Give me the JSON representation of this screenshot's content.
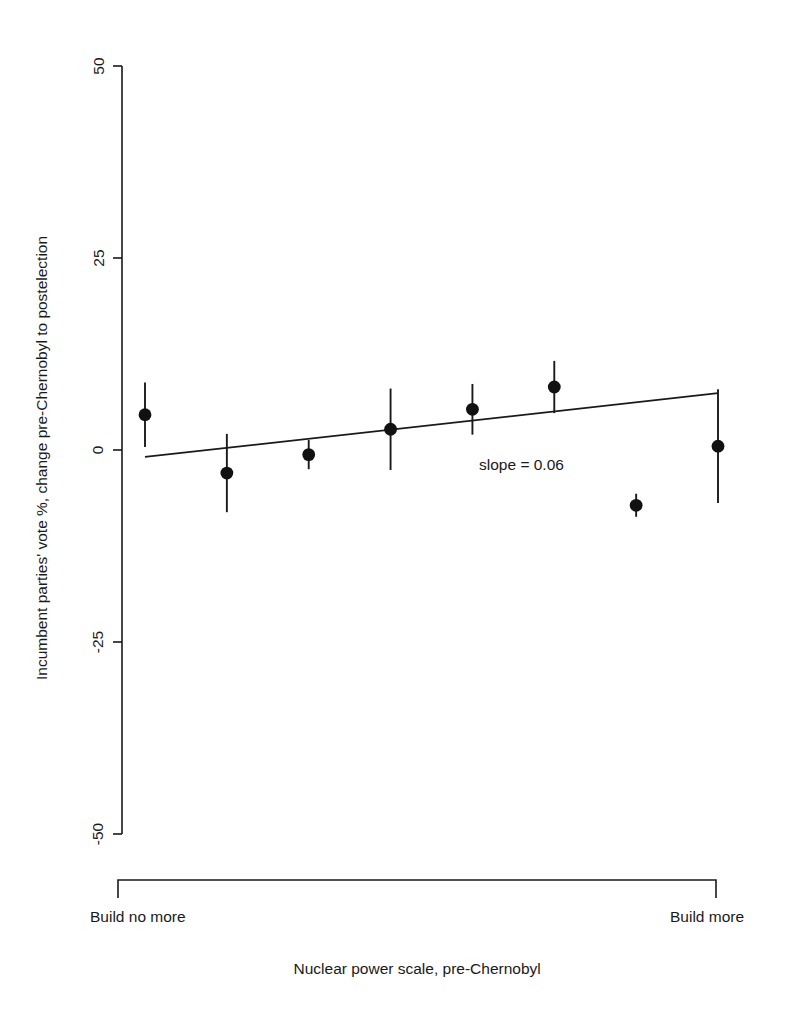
{
  "chart_data": {
    "type": "scatter",
    "title": "",
    "xlabel": "Nuclear power scale, pre-Chernobyl",
    "ylabel": "Incumbent parties' vote %, change pre-Chernobyl to postelection",
    "ylim": [
      -50,
      50
    ],
    "yticks": [
      50,
      25,
      0,
      -25,
      -50
    ],
    "ytick_labels": [
      "50",
      "25",
      "0",
      "-25",
      "-50"
    ],
    "xlim": [
      1,
      8
    ],
    "x_end_labels": {
      "left": "Build no more",
      "right": "Build more"
    },
    "grid": false,
    "legend": null,
    "annotations": [
      {
        "name": "slope-annotation",
        "text": "slope = 0.06",
        "x": 5.6,
        "y": -2.0
      }
    ],
    "series": [
      {
        "name": "Incumbent vote change by nuclear power scale",
        "marker": "filled-circle",
        "errorbars": "vertical",
        "points": [
          {
            "x": 1.0,
            "y": 4.6,
            "yerr": 4.2
          },
          {
            "x": 2.0,
            "y": -3.0,
            "yerr": 5.1
          },
          {
            "x": 3.0,
            "y": -0.6,
            "yerr": 1.9
          },
          {
            "x": 4.0,
            "y": 2.7,
            "yerr": 5.3
          },
          {
            "x": 5.0,
            "y": 5.3,
            "yerr": 3.3
          },
          {
            "x": 6.0,
            "y": 8.2,
            "yerr": 3.4
          },
          {
            "x": 7.0,
            "y": -7.2,
            "yerr": 1.5
          },
          {
            "x": 8.0,
            "y": 0.5,
            "yerr": 7.4
          }
        ]
      }
    ],
    "fit_line": {
      "name": "least-squares-fit",
      "slope": 0.06,
      "x_start": 1.0,
      "y_start": -0.9,
      "x_end": 8.0,
      "y_end": 7.4
    }
  }
}
